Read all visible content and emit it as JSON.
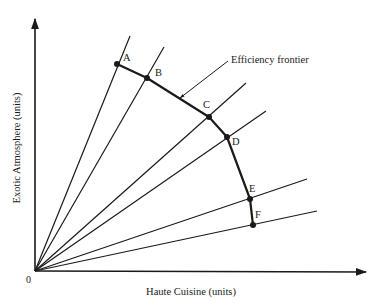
{
  "diagram": {
    "title": "Efficiency frontier",
    "x_axis_label": "Haute Cuisine (units)",
    "y_axis_label": "Exotic Atmosphere (units)",
    "origin_label": "0",
    "frontier_label": "Efficiency frontier",
    "colors": {
      "ink": "#1a1a1a",
      "background": "#ffffff"
    },
    "points": [
      {
        "label": "A",
        "x": 117,
        "y": 64,
        "ray_end": [
          130,
          36
        ],
        "label_pos": [
          123,
          61
        ]
      },
      {
        "label": "B",
        "x": 147,
        "y": 78,
        "ray_end": [
          164,
          47
        ],
        "label_pos": [
          155,
          76
        ]
      },
      {
        "label": "C",
        "x": 209,
        "y": 117,
        "ray_end": [
          246,
          83
        ],
        "label_pos": [
          203,
          108
        ]
      },
      {
        "label": "D",
        "x": 227,
        "y": 137,
        "ray_end": [
          266,
          111
        ],
        "label_pos": [
          232,
          145
        ]
      },
      {
        "label": "E",
        "x": 250,
        "y": 199,
        "ray_end": [
          307,
          179
        ],
        "label_pos": [
          249,
          192
        ]
      },
      {
        "label": "F",
        "x": 253,
        "y": 225,
        "ray_end": [
          317,
          211
        ],
        "label_pos": [
          255,
          218
        ]
      }
    ]
  }
}
